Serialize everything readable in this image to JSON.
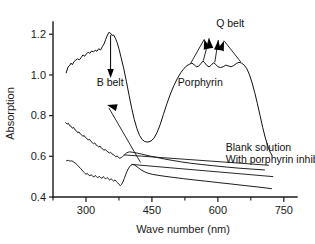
{
  "chart_data": {
    "type": "line",
    "title": "",
    "xlabel": "Wave number (nm)",
    "ylabel": "Absorption",
    "xlim": [
      225,
      780
    ],
    "ylim": [
      0.4,
      1.26
    ],
    "grid": false,
    "legend_position": "inline-annotations",
    "xticks": [
      300,
      450,
      600,
      750
    ],
    "xtick_labels": [
      "300",
      "450",
      "600",
      "750"
    ],
    "xticks_minor": [
      225,
      375,
      525,
      675
    ],
    "yticks": [
      0.4,
      0.6,
      0.8,
      1.0,
      1.2
    ],
    "ytick_labels": [
      "0.4",
      "0.6",
      "0.8",
      "1.0",
      "1.2"
    ],
    "annotations": [
      {
        "name": "b-belt",
        "text": "B belt",
        "x": 355,
        "y": 0.945
      },
      {
        "name": "q-belt",
        "text": "Q belt",
        "x": 628,
        "y": 1.235
      },
      {
        "name": "porphyrin",
        "text": "Porphyrin",
        "x": 560,
        "y": 0.945
      },
      {
        "name": "blank-solution",
        "text": "Blank solution",
        "x": 618,
        "y": 0.625
      },
      {
        "name": "with-porphyrin-inhibitor",
        "text": "With porphyrin inhibitor",
        "x": 618,
        "y": 0.567
      }
    ],
    "series": [
      {
        "name": "Porphyrin",
        "points": [
          [
            255,
            1.01
          ],
          [
            259,
            1.038
          ],
          [
            263,
            1.046
          ],
          [
            266,
            1.058
          ],
          [
            269,
            1.05
          ],
          [
            273,
            1.066
          ],
          [
            277,
            1.073
          ],
          [
            281,
            1.079
          ],
          [
            285,
            1.074
          ],
          [
            289,
            1.085
          ],
          [
            293,
            1.098
          ],
          [
            297,
            1.092
          ],
          [
            301,
            1.103
          ],
          [
            305,
            1.112
          ],
          [
            309,
            1.106
          ],
          [
            313,
            1.118
          ],
          [
            317,
            1.112
          ],
          [
            321,
            1.122
          ],
          [
            325,
            1.116
          ],
          [
            329,
            1.129
          ],
          [
            333,
            1.122
          ],
          [
            337,
            1.138
          ],
          [
            341,
            1.152
          ],
          [
            345,
            1.175
          ],
          [
            349,
            1.196
          ],
          [
            352,
            1.209
          ],
          [
            356,
            1.205
          ],
          [
            359,
            1.194
          ],
          [
            363,
            1.196
          ],
          [
            367,
            1.18
          ],
          [
            371,
            1.158
          ],
          [
            375,
            1.128
          ],
          [
            380,
            1.085
          ],
          [
            386,
            1.03
          ],
          [
            392,
            0.968
          ],
          [
            398,
            0.9
          ],
          [
            404,
            0.836
          ],
          [
            410,
            0.78
          ],
          [
            416,
            0.735
          ],
          [
            422,
            0.702
          ],
          [
            428,
            0.682
          ],
          [
            434,
            0.672
          ],
          [
            441,
            0.67
          ],
          [
            448,
            0.675
          ],
          [
            455,
            0.69
          ],
          [
            462,
            0.718
          ],
          [
            469,
            0.757
          ],
          [
            476,
            0.805
          ],
          [
            484,
            0.858
          ],
          [
            492,
            0.906
          ],
          [
            500,
            0.948
          ],
          [
            508,
            0.983
          ],
          [
            516,
            1.012
          ],
          [
            523,
            1.032
          ],
          [
            530,
            1.046
          ],
          [
            536,
            1.053
          ],
          [
            541,
            1.058
          ],
          [
            546,
            1.05
          ],
          [
            551,
            1.04
          ],
          [
            556,
            1.042
          ],
          [
            561,
            1.055
          ],
          [
            566,
            1.068
          ],
          [
            570,
            1.06
          ],
          [
            575,
            1.046
          ],
          [
            580,
            1.04
          ],
          [
            585,
            1.048
          ],
          [
            590,
            1.06
          ],
          [
            595,
            1.052
          ],
          [
            600,
            1.04
          ],
          [
            606,
            1.036
          ],
          [
            612,
            1.04
          ],
          [
            618,
            1.048
          ],
          [
            624,
            1.044
          ],
          [
            630,
            1.04
          ],
          [
            636,
            1.046
          ],
          [
            642,
            1.056
          ],
          [
            648,
            1.062
          ],
          [
            654,
            1.058
          ],
          [
            660,
            1.048
          ],
          [
            666,
            1.03
          ],
          [
            672,
            1.0
          ],
          [
            678,
            0.96
          ],
          [
            684,
            0.912
          ],
          [
            690,
            0.858
          ],
          [
            696,
            0.8
          ],
          [
            702,
            0.742
          ],
          [
            708,
            0.69
          ],
          [
            714,
            0.648
          ],
          [
            719,
            0.62
          ],
          [
            723,
            0.606
          ]
        ]
      },
      {
        "name": "Blank solution",
        "points": [
          [
            254,
            0.765
          ],
          [
            257,
            0.758
          ],
          [
            260,
            0.762
          ],
          [
            263,
            0.75
          ],
          [
            266,
            0.748
          ],
          [
            269,
            0.738
          ],
          [
            272,
            0.742
          ],
          [
            275,
            0.73
          ],
          [
            278,
            0.726
          ],
          [
            281,
            0.716
          ],
          [
            284,
            0.72
          ],
          [
            287,
            0.71
          ],
          [
            290,
            0.706
          ],
          [
            293,
            0.698
          ],
          [
            296,
            0.702
          ],
          [
            299,
            0.692
          ],
          [
            302,
            0.688
          ],
          [
            305,
            0.68
          ],
          [
            308,
            0.684
          ],
          [
            311,
            0.674
          ],
          [
            314,
            0.668
          ],
          [
            317,
            0.662
          ],
          [
            320,
            0.666
          ],
          [
            323,
            0.656
          ],
          [
            326,
            0.652
          ],
          [
            329,
            0.646
          ],
          [
            332,
            0.65
          ],
          [
            335,
            0.64
          ],
          [
            338,
            0.636
          ],
          [
            341,
            0.63
          ],
          [
            344,
            0.634
          ],
          [
            347,
            0.626
          ],
          [
            350,
            0.622
          ],
          [
            353,
            0.616
          ],
          [
            356,
            0.62
          ],
          [
            359,
            0.612
          ],
          [
            362,
            0.608
          ],
          [
            365,
            0.604
          ],
          [
            368,
            0.598
          ],
          [
            371,
            0.602
          ],
          [
            374,
            0.594
          ],
          [
            377,
            0.59
          ],
          [
            380,
            0.594
          ],
          [
            383,
            0.598
          ],
          [
            386,
            0.604
          ],
          [
            389,
            0.61
          ],
          [
            392,
            0.616
          ],
          [
            396,
            0.62
          ],
          [
            400,
            0.622
          ],
          [
            405,
            0.62
          ],
          [
            411,
            0.618
          ],
          [
            418,
            0.615
          ],
          [
            426,
            0.611
          ],
          [
            436,
            0.606
          ],
          [
            448,
            0.6
          ],
          [
            462,
            0.594
          ],
          [
            478,
            0.587
          ],
          [
            496,
            0.58
          ],
          [
            516,
            0.573
          ],
          [
            538,
            0.566
          ],
          [
            562,
            0.56
          ],
          [
            588,
            0.554
          ],
          [
            616,
            0.548
          ],
          [
            646,
            0.542
          ],
          [
            678,
            0.537
          ],
          [
            706,
            0.533
          ]
        ]
      },
      {
        "name": "With porphyrin inhibitor",
        "points": [
          [
            256,
            0.578
          ],
          [
            260,
            0.58
          ],
          [
            264,
            0.576
          ],
          [
            268,
            0.578
          ],
          [
            272,
            0.572
          ],
          [
            276,
            0.566
          ],
          [
            280,
            0.558
          ],
          [
            284,
            0.548
          ],
          [
            288,
            0.54
          ],
          [
            291,
            0.532
          ],
          [
            294,
            0.524
          ],
          [
            297,
            0.518
          ],
          [
            300,
            0.512
          ],
          [
            303,
            0.516
          ],
          [
            306,
            0.508
          ],
          [
            309,
            0.504
          ],
          [
            312,
            0.51
          ],
          [
            315,
            0.502
          ],
          [
            318,
            0.498
          ],
          [
            321,
            0.506
          ],
          [
            324,
            0.5
          ],
          [
            327,
            0.494
          ],
          [
            330,
            0.502
          ],
          [
            333,
            0.496
          ],
          [
            336,
            0.492
          ],
          [
            339,
            0.5
          ],
          [
            342,
            0.494
          ],
          [
            345,
            0.489
          ],
          [
            348,
            0.496
          ],
          [
            351,
            0.49
          ],
          [
            354,
            0.484
          ],
          [
            357,
            0.49
          ],
          [
            360,
            0.484
          ],
          [
            363,
            0.478
          ],
          [
            366,
            0.484
          ],
          [
            369,
            0.476
          ],
          [
            372,
            0.47
          ],
          [
            375,
            0.462
          ],
          [
            378,
            0.456
          ],
          [
            381,
            0.462
          ],
          [
            384,
            0.474
          ],
          [
            387,
            0.49
          ],
          [
            390,
            0.508
          ],
          [
            393,
            0.524
          ],
          [
            396,
            0.538
          ],
          [
            399,
            0.548
          ],
          [
            402,
            0.556
          ],
          [
            406,
            0.56
          ],
          [
            410,
            0.558
          ],
          [
            414,
            0.552
          ],
          [
            419,
            0.544
          ],
          [
            425,
            0.534
          ],
          [
            432,
            0.525
          ],
          [
            441,
            0.517
          ],
          [
            452,
            0.511
          ],
          [
            466,
            0.506
          ],
          [
            482,
            0.501
          ],
          [
            500,
            0.496
          ],
          [
            522,
            0.49
          ],
          [
            546,
            0.484
          ],
          [
            572,
            0.478
          ],
          [
            600,
            0.471
          ],
          [
            630,
            0.464
          ],
          [
            662,
            0.456
          ],
          [
            696,
            0.448
          ],
          [
            722,
            0.441
          ]
        ]
      }
    ]
  }
}
